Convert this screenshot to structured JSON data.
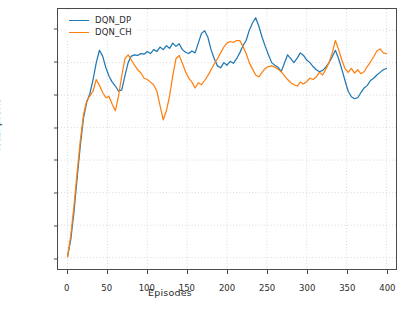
{
  "chart_data": {
    "type": "line",
    "title": "",
    "xlabel": "Episodes",
    "ylabel": "Total profit",
    "xlim": [
      -12,
      412
    ],
    "ylim": [
      -0.035,
      0.765
    ],
    "xticks": [
      0,
      50,
      100,
      150,
      200,
      250,
      300,
      350,
      400
    ],
    "xtick_labels": [
      "0",
      "50",
      "100",
      "150",
      "200",
      "250",
      "300",
      "350",
      "400"
    ],
    "yticks": [
      0.0,
      0.1,
      0.2,
      0.3,
      0.4,
      0.5,
      0.6,
      0.7
    ],
    "ytick_labels": [
      "0.0",
      "0.1",
      "0.2",
      "0.3",
      "0.4",
      "0.5",
      "0.6",
      "0.7"
    ],
    "grid": true,
    "grid_style": "dotted",
    "legend_position": "upper left",
    "colors": {
      "dqn_dp": "#1f77b4",
      "dqn_ch": "#ff7f0e",
      "axis": "#4a4a4a",
      "grid": "#c8c8c8",
      "text": "#2b2b2b",
      "background": "#ffffff"
    },
    "series": [
      {
        "name": "DQN_DP",
        "color": "#1f77b4",
        "x": [
          0,
          4,
          8,
          12,
          16,
          20,
          24,
          28,
          32,
          36,
          40,
          44,
          48,
          52,
          56,
          60,
          64,
          68,
          72,
          76,
          80,
          84,
          88,
          92,
          96,
          100,
          104,
          108,
          112,
          116,
          120,
          124,
          128,
          132,
          136,
          140,
          144,
          148,
          152,
          156,
          160,
          164,
          168,
          172,
          176,
          180,
          184,
          188,
          192,
          196,
          200,
          204,
          208,
          212,
          216,
          220,
          224,
          228,
          232,
          236,
          240,
          244,
          248,
          252,
          256,
          260,
          264,
          268,
          272,
          276,
          280,
          284,
          288,
          292,
          296,
          300,
          304,
          308,
          312,
          316,
          320,
          324,
          328,
          332,
          336,
          340,
          344,
          348,
          352,
          356,
          360,
          364,
          368,
          372,
          376,
          380,
          384,
          388,
          392,
          396,
          400
        ],
        "y": [
          0.003,
          0.055,
          0.14,
          0.245,
          0.345,
          0.43,
          0.478,
          0.505,
          0.548,
          0.6,
          0.638,
          0.62,
          0.585,
          0.558,
          0.54,
          0.528,
          0.512,
          0.516,
          0.56,
          0.6,
          0.62,
          0.624,
          0.622,
          0.628,
          0.626,
          0.634,
          0.628,
          0.64,
          0.634,
          0.648,
          0.64,
          0.652,
          0.644,
          0.66,
          0.65,
          0.658,
          0.64,
          0.632,
          0.628,
          0.636,
          0.63,
          0.66,
          0.69,
          0.698,
          0.678,
          0.64,
          0.612,
          0.59,
          0.584,
          0.6,
          0.592,
          0.604,
          0.598,
          0.612,
          0.63,
          0.652,
          0.668,
          0.7,
          0.722,
          0.738,
          0.712,
          0.678,
          0.65,
          0.624,
          0.6,
          0.592,
          0.586,
          0.572,
          0.598,
          0.624,
          0.612,
          0.6,
          0.614,
          0.63,
          0.622,
          0.608,
          0.6,
          0.588,
          0.578,
          0.572,
          0.576,
          0.586,
          0.6,
          0.618,
          0.638,
          0.612,
          0.58,
          0.545,
          0.512,
          0.495,
          0.489,
          0.492,
          0.508,
          0.522,
          0.53,
          0.545,
          0.552,
          0.562,
          0.57,
          0.578,
          0.582
        ]
      },
      {
        "name": "DQN_CH",
        "color": "#ff7f0e",
        "x": [
          0,
          4,
          8,
          12,
          16,
          20,
          24,
          28,
          32,
          36,
          40,
          44,
          48,
          52,
          56,
          60,
          64,
          68,
          72,
          76,
          80,
          84,
          88,
          92,
          96,
          100,
          104,
          108,
          112,
          116,
          120,
          124,
          128,
          132,
          136,
          140,
          144,
          148,
          152,
          156,
          160,
          164,
          168,
          172,
          176,
          180,
          184,
          188,
          192,
          196,
          200,
          204,
          208,
          212,
          216,
          220,
          224,
          228,
          232,
          236,
          240,
          244,
          248,
          252,
          256,
          260,
          264,
          268,
          272,
          276,
          280,
          284,
          288,
          292,
          296,
          300,
          304,
          308,
          312,
          316,
          320,
          324,
          328,
          332,
          336,
          340,
          344,
          348,
          352,
          356,
          360,
          364,
          368,
          372,
          376,
          380,
          384,
          388,
          392,
          396,
          400
        ],
        "y": [
          0.003,
          0.068,
          0.158,
          0.262,
          0.36,
          0.44,
          0.482,
          0.498,
          0.512,
          0.548,
          0.53,
          0.508,
          0.492,
          0.496,
          0.472,
          0.452,
          0.498,
          0.56,
          0.612,
          0.624,
          0.608,
          0.592,
          0.578,
          0.568,
          0.552,
          0.548,
          0.54,
          0.532,
          0.512,
          0.468,
          0.424,
          0.452,
          0.498,
          0.56,
          0.612,
          0.622,
          0.598,
          0.572,
          0.552,
          0.54,
          0.522,
          0.538,
          0.532,
          0.545,
          0.56,
          0.578,
          0.596,
          0.612,
          0.63,
          0.648,
          0.66,
          0.665,
          0.662,
          0.668,
          0.668,
          0.65,
          0.628,
          0.6,
          0.58,
          0.562,
          0.556,
          0.57,
          0.582,
          0.588,
          0.59,
          0.586,
          0.58,
          0.572,
          0.56,
          0.548,
          0.538,
          0.532,
          0.528,
          0.54,
          0.534,
          0.542,
          0.552,
          0.548,
          0.556,
          0.57,
          0.562,
          0.58,
          0.6,
          0.63,
          0.668,
          0.64,
          0.608,
          0.582,
          0.57,
          0.582,
          0.568,
          0.578,
          0.566,
          0.572,
          0.588,
          0.602,
          0.618,
          0.636,
          0.642,
          0.63,
          0.628
        ]
      }
    ]
  },
  "legend": {
    "items": [
      {
        "label": "DQN_DP",
        "color": "#1f77b4"
      },
      {
        "label": "DQN_CH",
        "color": "#ff7f0e"
      }
    ]
  }
}
